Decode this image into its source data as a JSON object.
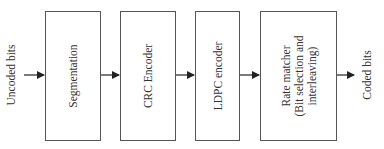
{
  "diagram": {
    "input_label": "Uncoded bits",
    "output_label": "Coded bits",
    "blocks": [
      {
        "id": "segmentation",
        "lines": [
          "Segmentation"
        ]
      },
      {
        "id": "crc-encoder",
        "lines": [
          "CRC Encoder"
        ]
      },
      {
        "id": "ldpc-encoder",
        "lines": [
          "LDPC encoder"
        ]
      },
      {
        "id": "rate-matcher",
        "lines": [
          "Rate matcher",
          "(Bit selection and",
          "interleaving)"
        ]
      }
    ],
    "edges": [
      {
        "from": "input",
        "to": "segmentation"
      },
      {
        "from": "segmentation",
        "to": "crc-encoder"
      },
      {
        "from": "crc-encoder",
        "to": "ldpc-encoder"
      },
      {
        "from": "ldpc-encoder",
        "to": "rate-matcher"
      },
      {
        "from": "rate-matcher",
        "to": "output"
      }
    ],
    "colors": {
      "stroke": "#555555",
      "arrow": "#222222",
      "text": "#333333"
    }
  }
}
